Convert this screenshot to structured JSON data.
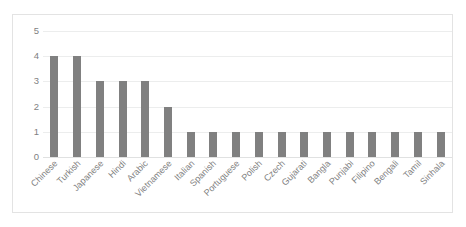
{
  "chart_data": {
    "type": "bar",
    "title": "",
    "subtitle": "",
    "xlabel": "",
    "ylabel": "",
    "ylim": [
      0,
      5
    ],
    "yticks": [
      "0",
      "1",
      "2",
      "3",
      "4",
      "5"
    ],
    "grid": true,
    "legend": false,
    "legend_position": "none",
    "bar_color": "#808080",
    "gridline_color": "#ECEDED",
    "tick_label_color": "#7F7F7F",
    "frame_color": "#E3E3E3",
    "background_color": "#FFFFFF",
    "xtick_rotation_deg": -45,
    "categories": [
      "Chinese",
      "Turkish",
      "Japanese",
      "Hindi",
      "Arabic",
      "Vietnamese",
      "Italian",
      "Spanish",
      "Portuguese",
      "Polish",
      "Czech",
      "Gujarati",
      "Bangla",
      "Punjabi",
      "Filipino",
      "Bengali",
      "Tamil",
      "Sinhala"
    ],
    "values": [
      4,
      4,
      3,
      3,
      3,
      2,
      1,
      1,
      1,
      1,
      1,
      1,
      1,
      1,
      1,
      1,
      1,
      1
    ]
  }
}
